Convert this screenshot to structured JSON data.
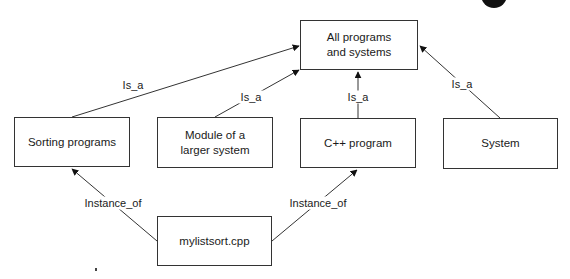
{
  "diagram": {
    "type": "class-hierarchy",
    "nodes": {
      "all_programs": {
        "label_line1": "All programs",
        "label_line2": "and systems"
      },
      "sorting": {
        "label": "Sorting programs"
      },
      "module": {
        "label_line1": "Module of a",
        "label_line2": "larger system"
      },
      "cpp": {
        "label": "C++ program"
      },
      "system": {
        "label": "System"
      },
      "mylistsort": {
        "label": "mylistsort.cpp"
      }
    },
    "edges": [
      {
        "from": "Sorting programs",
        "to": "All programs and systems",
        "label": "Is_a"
      },
      {
        "from": "Module of a larger system",
        "to": "All programs and systems",
        "label": "Is_a"
      },
      {
        "from": "C++ program",
        "to": "All programs and systems",
        "label": "Is_a"
      },
      {
        "from": "System",
        "to": "All programs and systems",
        "label": "Is_a"
      },
      {
        "from": "mylistsort.cpp",
        "to": "Sorting programs",
        "label": "Instance_of"
      },
      {
        "from": "mylistsort.cpp",
        "to": "C++ program",
        "label": "Instance_of"
      }
    ],
    "edge_labels": {
      "is_a_sorting": "Is_a",
      "is_a_module": "Is_a",
      "is_a_cpp": "Is_a",
      "is_a_system": "Is_a",
      "instance_of_sorting": "Instance_of",
      "instance_of_cpp": "Instance_of"
    }
  }
}
